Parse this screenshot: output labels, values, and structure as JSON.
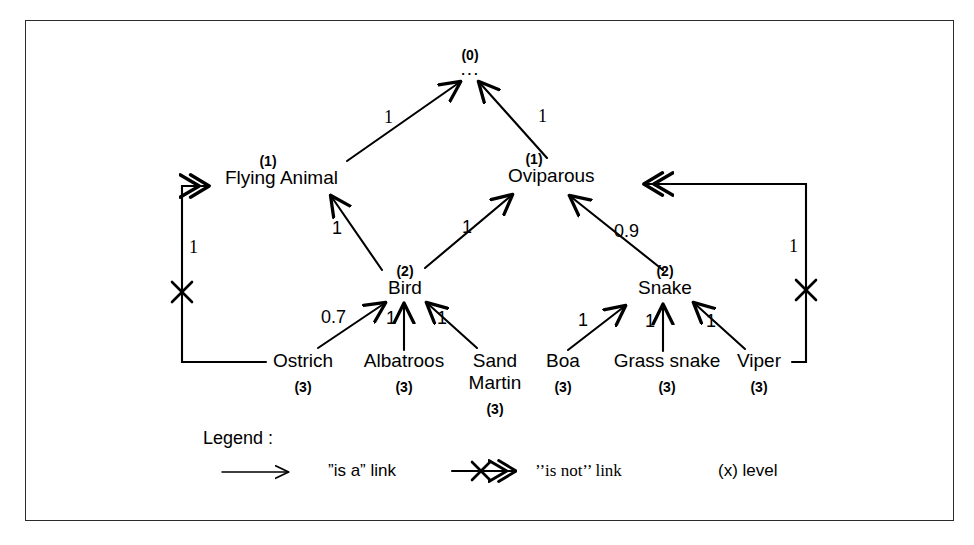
{
  "diagram": {
    "ink_color": "#000000",
    "frame_color": "#2b2b2b",
    "background": "#ffffff"
  },
  "nodes": {
    "root": {
      "label": "...",
      "level": "(0)"
    },
    "flying_animal": {
      "label": "Flying Animal",
      "level": "(1)"
    },
    "oviparous": {
      "label": "Oviparous",
      "level": "(1)"
    },
    "bird": {
      "label": "Bird",
      "level": "(2)"
    },
    "snake": {
      "label": "Snake",
      "level": "(2)"
    },
    "ostrich": {
      "label": "Ostrich",
      "level": "(3)"
    },
    "albatroos": {
      "label": "Albatroos",
      "level": "(3)"
    },
    "sand_martin_line1": {
      "label": "Sand",
      "label2": "Martin",
      "level": "(3)"
    },
    "boa": {
      "label": "Boa",
      "level": "(3)"
    },
    "grass_snake": {
      "label": "Grass snake",
      "level": "(3)"
    },
    "viper": {
      "label": "Viper",
      "level": "(3)"
    }
  },
  "weights": {
    "flying_animal_to_root": "1",
    "oviparous_to_root": "1",
    "bird_to_flying_animal": "1",
    "bird_to_oviparous": "1",
    "snake_to_oviparous": "0.9",
    "ostrich_to_bird": "0.7",
    "albatroos_to_bird": "1",
    "sand_martin_to_bird": "1",
    "boa_to_snake": "1",
    "grass_snake_to_snake": "1",
    "viper_to_snake": "1",
    "ostrich_not_flying_animal": "1",
    "viper_not_oviparous": "1"
  },
  "legend": {
    "title": "Legend :",
    "is_a_label": "”is a” link",
    "is_not_label": "’’is not’’ link",
    "level_label": "(x) level"
  }
}
